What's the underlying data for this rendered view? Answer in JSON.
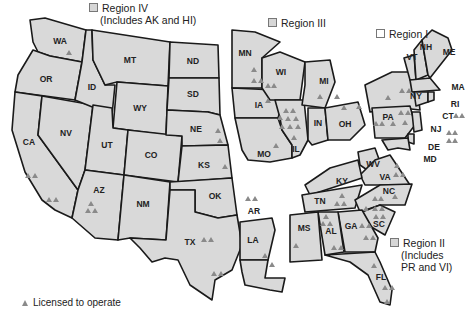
{
  "regions": [
    {
      "id": "region-iv",
      "label": "Region IV",
      "note": "(Includes AK and HI)"
    },
    {
      "id": "region-iii",
      "label": "Region III"
    },
    {
      "id": "region-i",
      "label": "Region I"
    },
    {
      "id": "region-ii",
      "label": "Region II",
      "note_line1": "(Includes",
      "note_line2": "PR and VI)"
    }
  ],
  "states": {
    "WA": "WA",
    "OR": "OR",
    "CA": "CA",
    "NV": "NV",
    "ID": "ID",
    "MT": "MT",
    "WY": "WY",
    "UT": "UT",
    "AZ": "AZ",
    "CO": "CO",
    "NM": "NM",
    "ND": "ND",
    "SD": "SD",
    "NE": "NE",
    "KS": "KS",
    "OK": "OK",
    "TX": "TX",
    "MN": "MN",
    "IA": "IA",
    "MO": "MO",
    "WI": "WI",
    "IL": "IL",
    "MI": "MI",
    "IN": "IN",
    "OH": "OH",
    "AR": "AR",
    "LA": "LA",
    "MS": "MS",
    "AL": "AL",
    "TN": "TN",
    "KY": "KY",
    "GA": "GA",
    "FL": "FL",
    "SC": "SC",
    "NC": "NC",
    "VA": "VA",
    "WV": "WV",
    "PA": "PA",
    "NY": "NY",
    "VT": "VT",
    "NH": "NH",
    "ME": "ME",
    "MA": "MA",
    "RI": "RI",
    "CT": "CT",
    "NJ": "NJ",
    "DE": "DE",
    "MD": "MD"
  },
  "legend": {
    "symbol": "triangle",
    "label": "Licensed to operate"
  },
  "colors": {
    "state_fill": "#d9d9d9",
    "border": "#1a1a1a",
    "marker": "#8a8a8a"
  }
}
